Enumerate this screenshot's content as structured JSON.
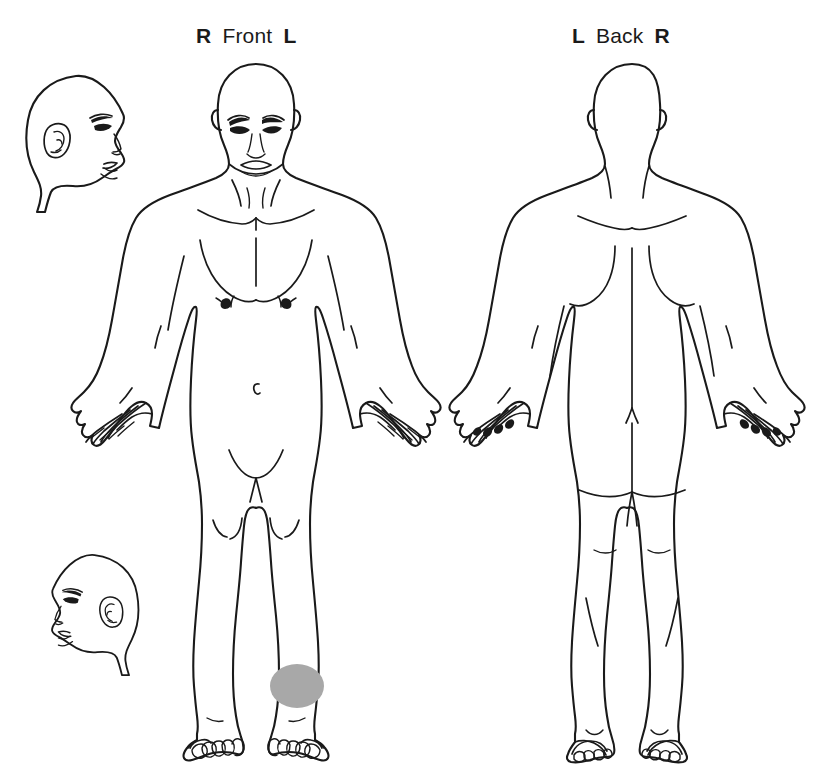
{
  "diagram": {
    "background_color": "#ffffff",
    "ink_color": "#1a1a1a",
    "views": [
      {
        "id": "front",
        "name": "Front",
        "left_letter": "R",
        "right_letter": "L",
        "label_text": "R Front L"
      },
      {
        "id": "back",
        "name": "Back",
        "left_letter": "L",
        "right_letter": "R",
        "label_text": "L Back R"
      }
    ],
    "figures": [
      {
        "id": "head-profile-upper",
        "name": "head-profile-right-facing"
      },
      {
        "id": "head-profile-lower",
        "name": "head-profile-left-facing"
      },
      {
        "id": "body-front",
        "name": "anterior-full-body"
      },
      {
        "id": "body-back",
        "name": "posterior-full-body"
      }
    ],
    "markings": [
      {
        "id": "mark-1",
        "region": "left lower leg / ankle",
        "view": "front",
        "shape": "ellipse",
        "color": "#a8a8a8"
      }
    ]
  }
}
